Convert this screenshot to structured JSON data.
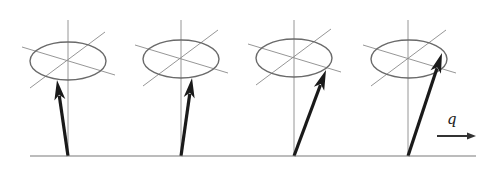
{
  "diagram": {
    "baseline": {
      "x1": 30,
      "x2": 476,
      "y": 156
    },
    "wavevector_label": "q",
    "wavevector_arrow": {
      "x1": 437,
      "x2": 476,
      "y": 136
    },
    "cones": [
      {
        "id": 1,
        "base_x": 68,
        "center": [
          68,
          61
        ],
        "rx": 38,
        "ry": 19,
        "tip": [
          57,
          80
        ]
      },
      {
        "id": 2,
        "base_x": 181,
        "center": [
          181,
          59
        ],
        "rx": 38,
        "ry": 19,
        "tip": [
          192,
          78
        ]
      },
      {
        "id": 3,
        "base_x": 294,
        "center": [
          294,
          58
        ],
        "rx": 38,
        "ry": 19,
        "tip": [
          326,
          70
        ]
      },
      {
        "id": 4,
        "base_x": 408,
        "center": [
          409,
          59
        ],
        "rx": 38,
        "ry": 19,
        "tip": [
          442,
          53
        ]
      }
    ],
    "colors": {
      "spin": "#1a1a1a",
      "guide": "#8a8a8a",
      "ellipse": "#6a6a6a"
    }
  }
}
